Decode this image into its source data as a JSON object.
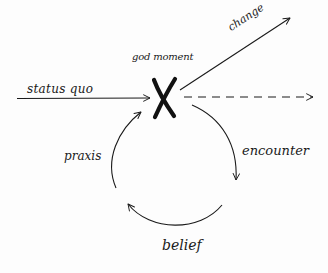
{
  "diagram": {
    "type": "cycle-with-breakout",
    "style": "hand-drawn sketch",
    "colors": {
      "ink": "#1a1a1a",
      "background": "#fdfdfd"
    },
    "labels": {
      "status_quo": "status quo",
      "god_moment": "god moment",
      "change": "change",
      "praxis": "praxis",
      "encounter": "encounter",
      "belief": "belief"
    },
    "nodes": [
      {
        "id": "x-mark",
        "label": "god moment",
        "symbol": "X"
      }
    ],
    "edges": [
      {
        "from": "status quo",
        "to": "god moment",
        "style": "solid-arrow"
      },
      {
        "from": "god moment",
        "to": "change",
        "style": "solid-arrow"
      },
      {
        "from": "god moment",
        "to": "continuation",
        "style": "dashed-arrow"
      },
      {
        "from": "god moment",
        "to": "encounter",
        "style": "cycle-arc"
      },
      {
        "from": "encounter",
        "to": "belief",
        "style": "cycle-arc"
      },
      {
        "from": "belief",
        "to": "praxis",
        "style": "cycle-arc"
      },
      {
        "from": "praxis",
        "to": "god moment",
        "style": "cycle-arc"
      }
    ]
  }
}
